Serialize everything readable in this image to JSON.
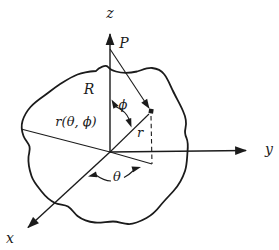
{
  "figure": {
    "colors": {
      "background": "#ffffff",
      "ink": "#1b1b1b"
    },
    "labels": {
      "z_axis": "z",
      "y_axis": "y",
      "x_axis": "x",
      "point_p": "P",
      "distance_R": "R",
      "vector_r": "r",
      "angle_phi": "ϕ",
      "angle_theta": "θ",
      "boundary_function": "r(θ, ϕ)"
    }
  }
}
